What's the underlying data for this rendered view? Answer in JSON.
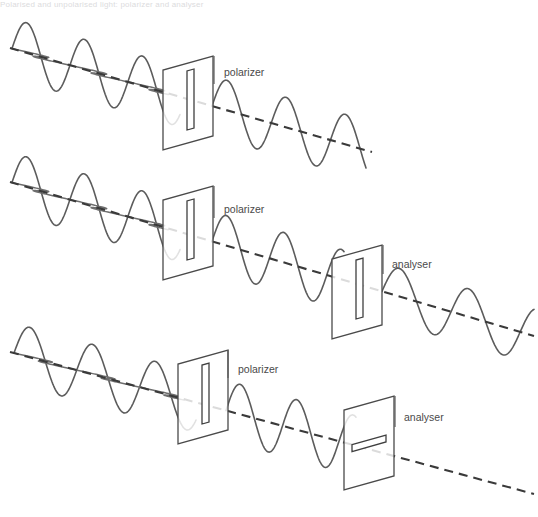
{
  "figure": {
    "top_caption_remnant": "Polarised and unpolarised light: polarizer and analyser",
    "background_color": "#ffffff",
    "line_color": "#5c5c5c",
    "axis_color": "#3a3a3a",
    "label_color": "#4a4a4a",
    "width": 538,
    "height": 517
  },
  "labels": {
    "polarizer": "polarizer",
    "analyser": "analyser"
  },
  "rows": [
    {
      "id": "row-1",
      "name": "unpolarised-light-through-polarizer",
      "description": "Unpolarised light passes through a polarizer and emerges vertically plane-polarised.",
      "axis": {
        "x1": 10,
        "y1": 48,
        "x2": 372,
        "y2": 152
      },
      "input_waves": [
        {
          "plane": "vertical",
          "amplitude": 30,
          "wavelength": 56,
          "cycles": 2.9,
          "x_start": 12,
          "x_end": 180
        },
        {
          "plane": "horizontal",
          "amplitude": 13,
          "wavelength": 56,
          "cycles": 2.9,
          "x_start": 12,
          "x_end": 180
        }
      ],
      "output_waves": [
        {
          "plane": "vertical",
          "amplitude": 30,
          "wavelength": 56,
          "cycles": 2.6,
          "x_start": 212,
          "x_end": 366
        }
      ],
      "plates": [
        {
          "name": "polarizer",
          "label": "polarizer",
          "label_x": 224,
          "label_y": 76,
          "slit_orientation": "vertical",
          "top_left_x": 163,
          "top_left_y": 56,
          "width": 36,
          "height": 80,
          "skew": 14,
          "slit_offset": 24,
          "slit_width": 7,
          "slit_inset": 14,
          "leader_x": 214,
          "leader_y1": 56,
          "leader_y2": 84
        }
      ]
    },
    {
      "id": "row-2",
      "name": "parallel-polarizer-and-analyser",
      "description": "Vertically polarised light passes through an analyser whose slit is also vertical, so light is transmitted.",
      "axis": {
        "x1": 10,
        "y1": 182,
        "x2": 534,
        "y2": 336
      },
      "input_waves": [
        {
          "plane": "vertical",
          "amplitude": 30,
          "wavelength": 56,
          "cycles": 2.9,
          "x_start": 12,
          "x_end": 180
        },
        {
          "plane": "horizontal",
          "amplitude": 13,
          "wavelength": 56,
          "cycles": 2.9,
          "x_start": 12,
          "x_end": 180
        }
      ],
      "output_waves": [
        {
          "plane": "vertical",
          "amplitude": 30,
          "wavelength": 58,
          "cycles": 2.3,
          "x_start": 212,
          "x_end": 344
        },
        {
          "plane": "vertical",
          "amplitude": 28,
          "wavelength": 56,
          "cycles": 2.2,
          "x_start": 382,
          "x_end": 534
        }
      ],
      "plates": [
        {
          "name": "polarizer",
          "label": "polarizer",
          "label_x": 224,
          "label_y": 213,
          "slit_orientation": "vertical",
          "top_left_x": 163,
          "top_left_y": 186,
          "width": 36,
          "height": 80,
          "skew": 14,
          "slit_offset": 24,
          "slit_width": 7,
          "slit_inset": 14,
          "leader_x": 214,
          "leader_y1": 186,
          "leader_y2": 218
        },
        {
          "name": "analyser",
          "label": "analyser",
          "label_x": 392,
          "label_y": 268,
          "slit_orientation": "vertical",
          "top_left_x": 332,
          "top_left_y": 245,
          "width": 36,
          "height": 80,
          "skew": 14,
          "slit_offset": 24,
          "slit_width": 7,
          "slit_inset": 14,
          "leader_x": 383,
          "leader_y1": 245,
          "leader_y2": 274
        }
      ]
    },
    {
      "id": "row-3",
      "name": "crossed-polarizer-and-analyser",
      "description": "Vertically polarised light meets an analyser with a horizontal slit, so no light is transmitted.",
      "axis": {
        "x1": 10,
        "y1": 352,
        "x2": 534,
        "y2": 494
      },
      "input_waves": [
        {
          "plane": "vertical",
          "amplitude": 30,
          "wavelength": 56,
          "cycles": 2.9,
          "x_start": 14,
          "x_end": 196
        },
        {
          "plane": "horizontal",
          "amplitude": 13,
          "wavelength": 56,
          "cycles": 2.9,
          "x_start": 14,
          "x_end": 196
        }
      ],
      "output_waves": [
        {
          "plane": "vertical",
          "amplitude": 30,
          "wavelength": 58,
          "cycles": 2.3,
          "x_start": 226,
          "x_end": 356
        }
      ],
      "plates": [
        {
          "name": "polarizer",
          "label": "polarizer",
          "label_x": 238,
          "label_y": 373,
          "slit_orientation": "vertical",
          "top_left_x": 178,
          "top_left_y": 350,
          "width": 36,
          "height": 80,
          "skew": 14,
          "slit_offset": 24,
          "slit_width": 7,
          "slit_inset": 14,
          "leader_x": 228,
          "leader_y1": 350,
          "leader_y2": 378
        },
        {
          "name": "analyser",
          "label": "analyser",
          "label_x": 404,
          "label_y": 421,
          "slit_orientation": "horizontal",
          "top_left_x": 344,
          "top_left_y": 396,
          "width": 36,
          "height": 80,
          "skew": 14,
          "slit_offset": 24,
          "slit_width": 7,
          "slit_inset": 8,
          "leader_x": 395,
          "leader_y1": 396,
          "leader_y2": 427
        }
      ]
    }
  ]
}
